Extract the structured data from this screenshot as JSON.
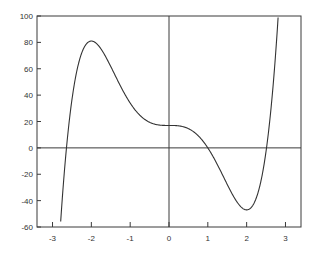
{
  "chart_data": {
    "type": "line",
    "title": "",
    "xlabel": "",
    "ylabel": "",
    "xlim": [
      -3.4,
      3.4
    ],
    "ylim": [
      -60,
      100
    ],
    "grid": false,
    "legend": null,
    "x_ticks": [
      -3,
      -2,
      -1,
      0,
      1,
      2,
      3
    ],
    "x_tick_labels": [
      "-3",
      "-2",
      "-1",
      "0",
      "1",
      "2",
      "3"
    ],
    "y_ticks": [
      -60,
      -40,
      -20,
      0,
      20,
      40,
      60,
      80,
      100
    ],
    "y_tick_labels": [
      "-60",
      "-40",
      "-20",
      "0",
      "20",
      "40",
      "60",
      "80",
      "100"
    ],
    "reference_lines": {
      "x": 0,
      "y": 0
    },
    "series": [
      {
        "name": "f(x) = 3x^5 - 20x^3 + 17",
        "color": "#333333",
        "x": [
          -2.64,
          -2.5,
          -2.25,
          -2.0,
          -1.75,
          -1.5,
          -1.25,
          -1.0,
          -0.75,
          -0.5,
          -0.25,
          0.0,
          0.25,
          0.5,
          0.75,
          1.0,
          1.25,
          1.5,
          1.75,
          2.0,
          2.25,
          2.5,
          2.75
        ],
        "y": [
          0,
          42.7,
          74.4,
          81,
          75.0,
          61.7,
          46.2,
          34,
          24.7,
          19.4,
          17.3,
          17,
          16.7,
          14.6,
          9.3,
          0,
          -12.2,
          -27.7,
          -41.0,
          -47,
          -40.4,
          -8.7,
          57.7
        ]
      }
    ]
  }
}
